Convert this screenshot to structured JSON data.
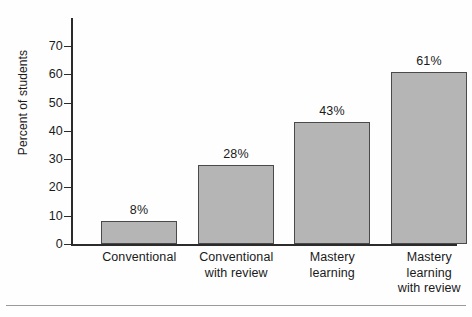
{
  "chart_data": {
    "type": "bar",
    "title": "",
    "subtitle": "",
    "xlabel": "",
    "ylabel": "Percent of students",
    "categories": [
      "Conventional",
      "Conventional with review",
      "Mastery learning",
      "Mastery learning with review"
    ],
    "category_lines": [
      [
        "Conventional"
      ],
      [
        "Conventional",
        "with review"
      ],
      [
        "Mastery",
        "learning"
      ],
      [
        "Mastery",
        "learning",
        "with review"
      ]
    ],
    "values": [
      8,
      28,
      43,
      61
    ],
    "data_labels": [
      "8%",
      "28%",
      "43%",
      "61%"
    ],
    "ylim": [
      0,
      75
    ],
    "yticks": [
      0,
      10,
      20,
      30,
      40,
      50,
      60,
      70
    ],
    "ytick_labels": [
      "0",
      "10",
      "20",
      "30",
      "40",
      "50",
      "60",
      "70"
    ],
    "grid": false,
    "legend": null,
    "bar_fill_color": "#b5b5b5",
    "bar_edge_color": "#4a4a4a",
    "axis_color": "#2b2b2b",
    "background_color": "#ffffff"
  }
}
